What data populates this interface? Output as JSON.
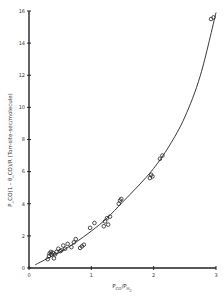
{
  "chart_data": {
    "type": "scatter",
    "title": "",
    "xlabel": "P_CO/P_H2",
    "ylabel": "P_CO(1 - θ_CO)/R (Torr-site-sec/molecule)",
    "xlim": [
      0,
      3
    ],
    "ylim": [
      0,
      16
    ],
    "x_ticks": [
      "0",
      "1",
      "2",
      "3"
    ],
    "y_ticks": [
      "0",
      "2",
      "4",
      "6",
      "8",
      "10",
      "12",
      "14",
      "16"
    ],
    "grid": false,
    "legend": null,
    "series": [
      {
        "name": "data",
        "marker": "open-circle",
        "points": [
          [
            0.3,
            0.55
          ],
          [
            0.32,
            0.75
          ],
          [
            0.33,
            0.9
          ],
          [
            0.35,
            1.0
          ],
          [
            0.36,
            0.85
          ],
          [
            0.38,
            0.95
          ],
          [
            0.4,
            0.6
          ],
          [
            0.42,
            0.85
          ],
          [
            0.44,
            1.0
          ],
          [
            0.47,
            1.2
          ],
          [
            0.5,
            1.05
          ],
          [
            0.52,
            1.1
          ],
          [
            0.55,
            1.4
          ],
          [
            0.58,
            1.2
          ],
          [
            0.62,
            1.5
          ],
          [
            0.68,
            1.3
          ],
          [
            0.72,
            1.6
          ],
          [
            0.75,
            1.8
          ],
          [
            0.82,
            1.25
          ],
          [
            0.85,
            1.35
          ],
          [
            0.88,
            1.45
          ],
          [
            0.98,
            2.5
          ],
          [
            1.05,
            2.8
          ],
          [
            1.2,
            2.6
          ],
          [
            1.22,
            2.9
          ],
          [
            1.25,
            3.1
          ],
          [
            1.27,
            2.7
          ],
          [
            1.3,
            3.2
          ],
          [
            1.44,
            4.0
          ],
          [
            1.46,
            4.2
          ],
          [
            1.48,
            4.3
          ],
          [
            1.94,
            5.6
          ],
          [
            1.96,
            5.8
          ],
          [
            1.98,
            5.7
          ],
          [
            2.1,
            6.8
          ],
          [
            2.14,
            7.0
          ],
          [
            2.92,
            15.5
          ],
          [
            2.96,
            15.6
          ]
        ]
      },
      {
        "name": "fit",
        "type": "line",
        "points": [
          [
            0.1,
            0.2
          ],
          [
            0.3,
            0.6
          ],
          [
            0.5,
            1.0
          ],
          [
            0.75,
            1.6
          ],
          [
            1.0,
            2.3
          ],
          [
            1.25,
            3.1
          ],
          [
            1.5,
            4.1
          ],
          [
            1.75,
            5.1
          ],
          [
            2.0,
            6.2
          ],
          [
            2.25,
            7.6
          ],
          [
            2.5,
            9.4
          ],
          [
            2.75,
            12.0
          ],
          [
            3.0,
            15.9
          ]
        ]
      }
    ]
  },
  "axes": {
    "x_title_main": "P",
    "x_title_sub1": "CO",
    "x_title_mid": "/P",
    "x_title_sub2": "H",
    "x_title_sub3": "2",
    "y_title": "P_CO(1 - θ_CO)/R (Torr-site-sec/molecule)"
  }
}
